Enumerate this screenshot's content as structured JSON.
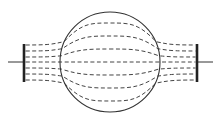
{
  "diagram": {
    "colors": {
      "background": "#ffffff",
      "stroke": "#333333",
      "plate": "#222222",
      "field_line": "#444444"
    },
    "sphere": {
      "cx": 110,
      "cy": 62,
      "r": 50
    },
    "left_plate": {
      "x": 24,
      "y1": 44,
      "y2": 82
    },
    "right_plate": {
      "x": 197,
      "y1": 44,
      "y2": 82
    },
    "left_lead": {
      "x1": 8,
      "x2": 24,
      "y": 62
    },
    "right_lead": {
      "x1": 197,
      "x2": 213,
      "y": 62
    },
    "field_lines": [
      {
        "plate_y": 45,
        "sphere_y": 23
      },
      {
        "plate_y": 51,
        "sphere_y": 36
      },
      {
        "plate_y": 57,
        "sphere_y": 49
      },
      {
        "plate_y": 62,
        "sphere_y": 62
      },
      {
        "plate_y": 68,
        "sphere_y": 75
      },
      {
        "plate_y": 74,
        "sphere_y": 88
      },
      {
        "plate_y": 80,
        "sphere_y": 101
      }
    ]
  }
}
